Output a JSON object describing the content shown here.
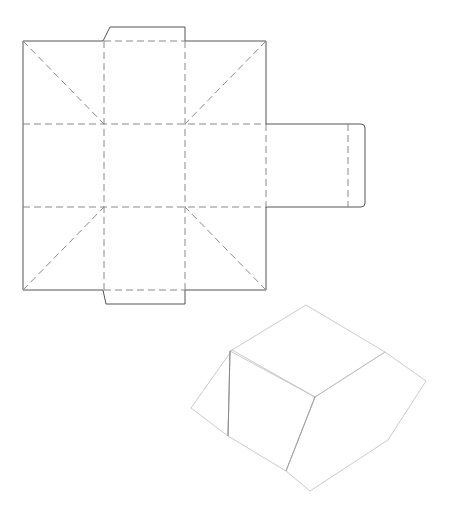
{
  "diagram": {
    "type": "packaging-die-line",
    "net": {
      "outer_square": {
        "x1": 23,
        "y1": 41,
        "x2": 266,
        "y2": 290
      },
      "top_tab": [
        [
          103,
          41
        ],
        [
          110,
          27
        ],
        [
          185,
          27
        ],
        [
          185,
          41
        ]
      ],
      "bottom_tab": [
        [
          103,
          290
        ],
        [
          106,
          304
        ],
        [
          185,
          304
        ],
        [
          185,
          290
        ]
      ],
      "side_flap": {
        "x1": 266,
        "y1": 124,
        "x2": 365,
        "y2": 207,
        "fold_x": 348
      },
      "fold_lines_vertical_x": [
        104,
        185
      ],
      "fold_lines_horizontal_y": [
        124,
        207
      ],
      "diagonal_folds": [
        [
          [
            23,
            41
          ],
          [
            104,
            124
          ]
        ],
        [
          [
            266,
            41
          ],
          [
            185,
            124
          ]
        ],
        [
          [
            23,
            290
          ],
          [
            104,
            207
          ]
        ],
        [
          [
            266,
            290
          ],
          [
            185,
            207
          ]
        ]
      ]
    },
    "render_3d": {
      "faces": [
        {
          "name": "top",
          "points": [
            [
              306,
              305
            ],
            [
              232,
              350
            ],
            [
              315,
              397
            ],
            [
              385,
              352
            ]
          ],
          "shade": [
            "#a8a8a8",
            "#f2f2f2"
          ]
        },
        {
          "name": "left-bevel",
          "points": [
            [
              232,
              350
            ],
            [
              191,
              408
            ],
            [
              228,
              436
            ],
            [
              230,
              351
            ]
          ],
          "shade": [
            "#f5f5f5",
            "#9a9a9a"
          ]
        },
        {
          "name": "front",
          "points": [
            [
              230,
              351
            ],
            [
              228,
              436
            ],
            [
              286,
              471
            ],
            [
              315,
              397
            ]
          ],
          "shade": [
            "#8e8e8e",
            "#fafafa"
          ]
        },
        {
          "name": "right",
          "points": [
            [
              315,
              397
            ],
            [
              286,
              471
            ],
            [
              310,
              491
            ],
            [
              388,
              440
            ],
            [
              426,
              381
            ],
            [
              385,
              352
            ]
          ],
          "shade": [
            "#ffffff",
            "#8f8f8f"
          ]
        }
      ],
      "colors": {
        "light": "#f7f7f7",
        "mid": "#c8c8c8",
        "dark": "#8c8c8c"
      }
    }
  }
}
